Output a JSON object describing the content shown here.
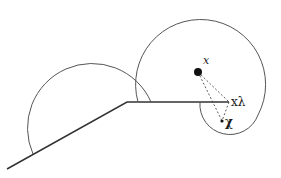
{
  "diagram": {
    "labels": {
      "center_point": "x",
      "projected_point": "xλ",
      "query_point": "χ"
    },
    "colors": {
      "stroke": "#333333",
      "dashed": "#333333",
      "background": "#ffffff"
    }
  }
}
